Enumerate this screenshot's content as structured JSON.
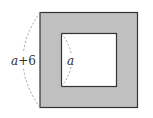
{
  "diagram": {
    "outer_label": "a+6",
    "outer_label_parts": {
      "var": "a",
      "op": "+",
      "num": "6"
    },
    "inner_label": "a",
    "colors": {
      "frame_fill": "#c0c0c0",
      "inner_fill": "#ffffff",
      "stroke": "#333333",
      "dash": "#999999"
    }
  }
}
